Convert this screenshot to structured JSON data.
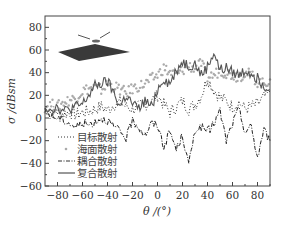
{
  "chart_data": {
    "type": "line",
    "title": "",
    "xlabel": "θ /(°)",
    "ylabel": "σ /dBsm",
    "xlim": [
      -90,
      90
    ],
    "ylim": [
      -60,
      90
    ],
    "xticks": [
      -80,
      -60,
      -40,
      -20,
      0,
      20,
      40,
      60,
      80
    ],
    "xtick_labels": [
      "−80",
      "−60",
      "−40",
      "−20",
      "0",
      "20",
      "40",
      "60",
      "80"
    ],
    "yticks": [
      -60,
      -40,
      -20,
      0,
      20,
      40,
      60,
      80
    ],
    "ytick_labels": [
      "−60",
      "−40",
      "−20",
      "0",
      "20",
      "40",
      "60",
      "80"
    ],
    "grid": false,
    "legend_position": "lower-left",
    "inset": "sea-surface-with-target-diagram",
    "series": [
      {
        "name": "目标散射",
        "style": "dotted",
        "color": "#333333",
        "x": [
          -90,
          -85,
          -80,
          -75,
          -70,
          -65,
          -60,
          -55,
          -50,
          -45,
          -40,
          -35,
          -30,
          -25,
          -20,
          -15,
          -10,
          -5,
          0,
          5,
          10,
          15,
          20,
          25,
          30,
          35,
          40,
          45,
          50,
          55,
          60,
          65,
          70,
          75,
          80,
          85,
          90
        ],
        "y": [
          8,
          5,
          6,
          4,
          5,
          3,
          5,
          6,
          8,
          10,
          7,
          12,
          14,
          10,
          8,
          10,
          12,
          15,
          20,
          12,
          5,
          10,
          15,
          8,
          12,
          20,
          35,
          25,
          18,
          15,
          10,
          14,
          8,
          10,
          12,
          18,
          22
        ]
      },
      {
        "name": "海面散射",
        "style": "points",
        "color": "#aaaaaa",
        "x": [
          -90,
          -85,
          -80,
          -75,
          -70,
          -65,
          -60,
          -55,
          -50,
          -45,
          -40,
          -35,
          -30,
          -25,
          -20,
          -15,
          -10,
          -5,
          0,
          5,
          10,
          15,
          20,
          25,
          30,
          35,
          40,
          45,
          50,
          55,
          60,
          65,
          70,
          75,
          80,
          85,
          90
        ],
        "y": [
          10,
          12,
          10,
          14,
          16,
          18,
          24,
          26,
          27,
          25,
          30,
          28,
          25,
          22,
          26,
          28,
          30,
          34,
          38,
          44,
          40,
          38,
          42,
          46,
          44,
          48,
          36,
          38,
          42,
          40,
          38,
          36,
          40,
          38,
          32,
          30,
          34
        ]
      },
      {
        "name": "耦合散射",
        "style": "dash-dot",
        "color": "#222222",
        "x": [
          -90,
          -85,
          -80,
          -75,
          -70,
          -65,
          -60,
          -55,
          -50,
          -45,
          -40,
          -35,
          -30,
          -25,
          -20,
          -15,
          -10,
          -5,
          0,
          5,
          10,
          15,
          20,
          25,
          30,
          35,
          40,
          45,
          50,
          55,
          60,
          65,
          70,
          75,
          80,
          85,
          90
        ],
        "y": [
          5,
          2,
          0,
          -2,
          -5,
          -8,
          -4,
          -6,
          -3,
          0,
          -2,
          -8,
          -12,
          -18,
          -2,
          -8,
          -15,
          -5,
          -6,
          -25,
          -12,
          -28,
          -15,
          -42,
          -10,
          -8,
          -12,
          -5,
          6,
          -20,
          -5,
          8,
          -12,
          -8,
          -35,
          -10,
          -20
        ]
      },
      {
        "name": "复合散射",
        "style": "solid",
        "color": "#555555",
        "x": [
          -90,
          -85,
          -80,
          -75,
          -70,
          -65,
          -60,
          -55,
          -50,
          -45,
          -40,
          -35,
          -30,
          -25,
          -20,
          -15,
          -10,
          -5,
          0,
          5,
          10,
          15,
          20,
          25,
          30,
          35,
          40,
          45,
          50,
          55,
          60,
          65,
          70,
          75,
          80,
          85,
          90
        ],
        "y": [
          10,
          8,
          10,
          6,
          8,
          10,
          12,
          20,
          28,
          30,
          32,
          22,
          10,
          20,
          12,
          8,
          15,
          10,
          25,
          35,
          30,
          42,
          50,
          46,
          48,
          38,
          45,
          58,
          42,
          44,
          40,
          38,
          42,
          40,
          35,
          30,
          25
        ]
      }
    ]
  },
  "legend": {
    "items": [
      {
        "label": "目标散射",
        "style": "dotted"
      },
      {
        "label": "海面散射",
        "style": "points"
      },
      {
        "label": "耦合散射",
        "style": "dash-dot"
      },
      {
        "label": "复合散射",
        "style": "solid"
      }
    ]
  },
  "axes": {
    "xlabel": "θ /(°)",
    "ylabel": "σ /dBsm"
  }
}
